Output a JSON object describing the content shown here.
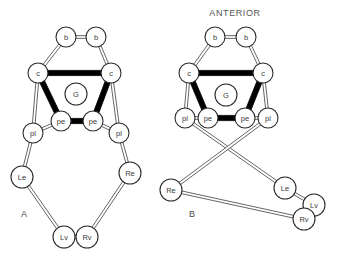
{
  "figure": {
    "heading": "ANTERIOR",
    "background_color": "#ffffff",
    "node_fill": "#ffffff",
    "node_stroke": "#2b2b2b",
    "thick_edge_color": "#000000",
    "thin_edge_color": "#555555",
    "label_color": "#3a3a3a",
    "width": 337,
    "height": 253
  },
  "panels": [
    {
      "id": "panel-a",
      "label": "A",
      "label_x": 24,
      "label_y": 214,
      "nodes": [
        {
          "id": "a-b-left",
          "label": "b",
          "x": 66,
          "y": 37,
          "r": 10
        },
        {
          "id": "a-b-right",
          "label": "b",
          "x": 96,
          "y": 37,
          "r": 10
        },
        {
          "id": "a-c-left",
          "label": "c",
          "x": 38,
          "y": 73,
          "r": 10
        },
        {
          "id": "a-c-right",
          "label": "c",
          "x": 111,
          "y": 73,
          "r": 10
        },
        {
          "id": "a-g",
          "label": "G",
          "x": 76,
          "y": 94,
          "r": 11
        },
        {
          "id": "a-pe-left",
          "label": "pe",
          "x": 61,
          "y": 121,
          "r": 10
        },
        {
          "id": "a-pe-right",
          "label": "pe",
          "x": 93,
          "y": 121,
          "r": 10
        },
        {
          "id": "a-pl-left",
          "label": "pl",
          "x": 33,
          "y": 133,
          "r": 10
        },
        {
          "id": "a-pl-right",
          "label": "pl",
          "x": 119,
          "y": 133,
          "r": 10
        },
        {
          "id": "a-le",
          "label": "Le",
          "x": 22,
          "y": 177,
          "r": 11
        },
        {
          "id": "a-re",
          "label": "Re",
          "x": 130,
          "y": 173,
          "r": 11
        },
        {
          "id": "a-lv",
          "label": "Lv",
          "x": 64,
          "y": 237,
          "r": 11
        },
        {
          "id": "a-rv",
          "label": "Rv",
          "x": 87,
          "y": 237,
          "r": 11
        }
      ],
      "edges": [
        {
          "from": "a-b-left",
          "to": "a-b-right",
          "style": "thin"
        },
        {
          "from": "a-b-left",
          "to": "a-c-left",
          "style": "thin"
        },
        {
          "from": "a-b-right",
          "to": "a-c-right",
          "style": "thin"
        },
        {
          "from": "a-c-left",
          "to": "a-c-right",
          "style": "thick"
        },
        {
          "from": "a-c-left",
          "to": "a-pe-left",
          "style": "thick"
        },
        {
          "from": "a-c-right",
          "to": "a-pe-right",
          "style": "thick"
        },
        {
          "from": "a-pe-left",
          "to": "a-pe-right",
          "style": "thick"
        },
        {
          "from": "a-c-left",
          "to": "a-pl-left",
          "style": "thin"
        },
        {
          "from": "a-c-right",
          "to": "a-pl-right",
          "style": "thin"
        },
        {
          "from": "a-pe-left",
          "to": "a-pl-left",
          "style": "thin"
        },
        {
          "from": "a-pe-right",
          "to": "a-pl-right",
          "style": "thin"
        },
        {
          "from": "a-pl-left",
          "to": "a-le",
          "style": "thin"
        },
        {
          "from": "a-pl-right",
          "to": "a-re",
          "style": "thin"
        },
        {
          "from": "a-le",
          "to": "a-lv",
          "style": "thin"
        },
        {
          "from": "a-re",
          "to": "a-rv",
          "style": "thin"
        },
        {
          "from": "a-lv",
          "to": "a-rv",
          "style": "thin"
        }
      ]
    },
    {
      "id": "panel-b",
      "label": "B",
      "label_x": 192,
      "label_y": 214,
      "heading_x": 235,
      "heading_y": 13,
      "nodes": [
        {
          "id": "b-b-left",
          "label": "b",
          "x": 215,
          "y": 37,
          "r": 10
        },
        {
          "id": "b-b-right",
          "label": "b",
          "x": 246,
          "y": 37,
          "r": 10
        },
        {
          "id": "b-c-left",
          "label": "c",
          "x": 189,
          "y": 73,
          "r": 10
        },
        {
          "id": "b-c-right",
          "label": "c",
          "x": 263,
          "y": 73,
          "r": 10
        },
        {
          "id": "b-g",
          "label": "G",
          "x": 226,
          "y": 95,
          "r": 11
        },
        {
          "id": "b-pe-left",
          "label": "pe",
          "x": 208,
          "y": 118,
          "r": 10
        },
        {
          "id": "b-pe-right",
          "label": "pe",
          "x": 245,
          "y": 118,
          "r": 10
        },
        {
          "id": "b-pl-left",
          "label": "pl",
          "x": 185,
          "y": 118,
          "r": 10
        },
        {
          "id": "b-pl-right",
          "label": "pl",
          "x": 268,
          "y": 118,
          "r": 10
        },
        {
          "id": "b-re",
          "label": "Re",
          "x": 171,
          "y": 190,
          "r": 11
        },
        {
          "id": "b-le",
          "label": "Le",
          "x": 285,
          "y": 188,
          "r": 11
        },
        {
          "id": "b-lv",
          "label": "Lv",
          "x": 314,
          "y": 205,
          "r": 11
        },
        {
          "id": "b-rv",
          "label": "Rv",
          "x": 304,
          "y": 219,
          "r": 11
        }
      ],
      "edges": [
        {
          "from": "b-b-left",
          "to": "b-b-right",
          "style": "thin"
        },
        {
          "from": "b-b-left",
          "to": "b-c-left",
          "style": "thin"
        },
        {
          "from": "b-b-right",
          "to": "b-c-right",
          "style": "thin"
        },
        {
          "from": "b-c-left",
          "to": "b-c-right",
          "style": "thick"
        },
        {
          "from": "b-c-left",
          "to": "b-pe-left",
          "style": "thick"
        },
        {
          "from": "b-c-right",
          "to": "b-pe-right",
          "style": "thick"
        },
        {
          "from": "b-pe-left",
          "to": "b-pe-right",
          "style": "thick"
        },
        {
          "from": "b-c-left",
          "to": "b-pl-left",
          "style": "thin"
        },
        {
          "from": "b-c-right",
          "to": "b-pl-right",
          "style": "thin"
        },
        {
          "from": "b-pe-left",
          "to": "b-pl-left",
          "style": "thin"
        },
        {
          "from": "b-pe-right",
          "to": "b-pl-right",
          "style": "thin"
        },
        {
          "from": "b-pl-left",
          "to": "b-le",
          "style": "thin"
        },
        {
          "from": "b-pl-right",
          "to": "b-re",
          "style": "thin"
        },
        {
          "from": "b-le",
          "to": "b-lv",
          "style": "thin"
        },
        {
          "from": "b-re",
          "to": "b-rv",
          "style": "thin"
        },
        {
          "from": "b-lv",
          "to": "b-rv",
          "style": "thin"
        }
      ]
    }
  ]
}
